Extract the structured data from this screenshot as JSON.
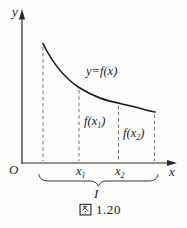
{
  "figure": {
    "y_axis_label": "y",
    "x_axis_label": "x",
    "origin_label": "O",
    "curve_label": "y=f(x)",
    "interval_label": "I",
    "value_labels": {
      "f_x1": {
        "base": "f(x",
        "sub": "1",
        "close": ")"
      },
      "f_x2": {
        "base": "f(x",
        "sub": "2",
        "close": ")"
      }
    },
    "tick_labels": {
      "x1": {
        "base": "x",
        "sub": "1"
      },
      "x2": {
        "base": "x",
        "sub": "2"
      }
    },
    "caption": "图 1.20",
    "caption_figure_word": "图",
    "caption_number": "1.20"
  },
  "colors": {
    "ink": "#1a1a1a",
    "dashed_line": "#777777",
    "background": "#fcfcfa"
  }
}
